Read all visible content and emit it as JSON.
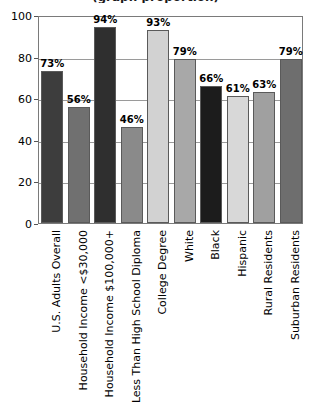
{
  "chart_data": {
    "type": "bar",
    "title": "(graph proportion)",
    "title_clipped": true,
    "xlabel": "",
    "ylabel": "",
    "ylim": [
      0,
      100
    ],
    "ytick_values": [
      0,
      20,
      40,
      60,
      80,
      100
    ],
    "ytick_labels": [
      "0",
      "20",
      "40",
      "60",
      "80",
      "100"
    ],
    "grid": true,
    "legend": "none",
    "value_suffix": "%",
    "categories": [
      "U.S. Adults Overall",
      "Household Income <$30,000",
      "Household Income $100,000+",
      "Less Than High School Diploma",
      "College Degree",
      "White",
      "Black",
      "Hispanic",
      "Rural Residents",
      "Suburban Residents"
    ],
    "values": [
      73,
      56,
      94,
      46,
      93,
      79,
      66,
      61,
      63,
      79
    ],
    "value_labels": [
      "73%",
      "56%",
      "94%",
      "46%",
      "93%",
      "79%",
      "66%",
      "61%",
      "63%",
      "79%"
    ],
    "bar_colors": [
      "#3d3d3d",
      "#707070",
      "#2f2f2f",
      "#8a8a8a",
      "#d2d2d2",
      "#a8a8a8",
      "#1c1c1c",
      "#d8d8d8",
      "#a0a0a0",
      "#6e6e6e"
    ]
  }
}
